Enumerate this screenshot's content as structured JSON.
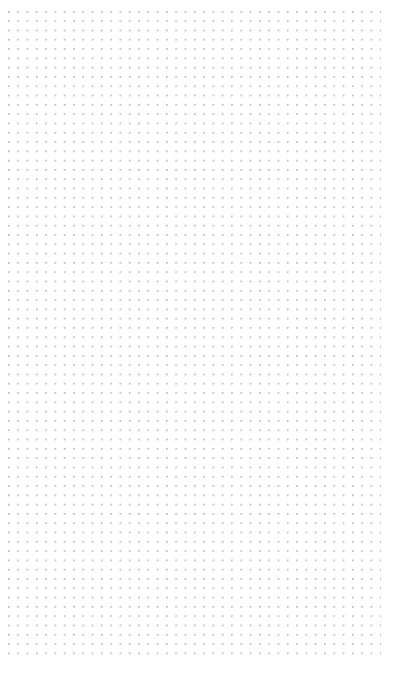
{
  "page": {
    "kind": "dot-grid-paper",
    "width_px": 414,
    "height_px": 674,
    "background_color": "#ffffff",
    "has_text": false,
    "has_controls": false,
    "visible_text": ""
  },
  "grid": {
    "name": "dot-grid",
    "pattern": "dots",
    "dot_color": "#b9b9c2",
    "dot_diameter_px": 1.4,
    "spacing_x_px": 9.3,
    "spacing_y_px": 9.3,
    "origin_x_px": 8,
    "origin_y_px": 11,
    "field_left_px": 8,
    "field_top_px": 11,
    "field_right_px": 381,
    "field_bottom_px": 658,
    "field_width_px": 373,
    "field_height_px": 647,
    "columns": 41,
    "rows": 70,
    "margin_left_px": 8,
    "margin_top_px": 11,
    "margin_right_px": 33,
    "margin_bottom_px": 16
  }
}
